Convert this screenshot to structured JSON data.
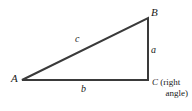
{
  "figure": {
    "type": "right-triangle-diagram",
    "background_color": "#ffffff",
    "stroke_color": "#3a3a3a",
    "vertices": {
      "A": {
        "label": "A",
        "x": 22,
        "y": 80
      },
      "B": {
        "label": "B",
        "x": 148,
        "y": 18
      },
      "C": {
        "label": "C",
        "x": 148,
        "y": 80
      }
    },
    "sides": {
      "a": {
        "label": "a",
        "from": "B",
        "to": "C",
        "description": "vertical leg"
      },
      "b": {
        "label": "b",
        "from": "A",
        "to": "C",
        "description": "horizontal leg"
      },
      "c": {
        "label": "c",
        "from": "A",
        "to": "B",
        "description": "hypotenuse"
      }
    },
    "annotations": {
      "right_angle_line1_vertex": "C",
      "right_angle_line1_rest": " (right",
      "right_angle_line2": "angle)"
    }
  }
}
